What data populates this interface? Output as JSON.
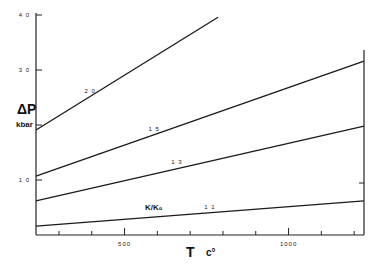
{
  "chart_data": {
    "type": "line",
    "title": "",
    "xlabel": "T",
    "xlabel_unit": "c°",
    "ylabel": "ΔP",
    "ylabel_unit": "kbar",
    "xlim": [
      230,
      1230
    ],
    "ylim": [
      0,
      40
    ],
    "x_ticks": [
      300,
      400,
      500,
      600,
      700,
      800,
      900,
      1000,
      1100,
      1200
    ],
    "x_tick_labels": [
      {
        "value": 500,
        "label": "500"
      },
      {
        "value": 1000,
        "label": "1000"
      }
    ],
    "y_ticks": [
      10,
      20,
      30,
      40
    ],
    "y_tick_labels": [
      {
        "value": 10,
        "label": "1 0"
      },
      {
        "value": 30,
        "label": "3 0"
      },
      {
        "value": 40,
        "label": "4 0"
      }
    ],
    "grid": false,
    "parameter_label": "K/K₀",
    "series": [
      {
        "name": "2.0",
        "label": "2 0",
        "x": [
          230,
          785
        ],
        "y": [
          19.1,
          39.6
        ],
        "label_at": [
          395,
          25.5
        ]
      },
      {
        "name": "1.5",
        "label": "1 5",
        "x": [
          230,
          1230
        ],
        "y": [
          10.7,
          31.6
        ],
        "label_at": [
          590,
          18.6
        ]
      },
      {
        "name": "1.3",
        "label": "1 3",
        "x": [
          230,
          1230
        ],
        "y": [
          6.2,
          19.8
        ],
        "label_at": [
          660,
          12.6
        ]
      },
      {
        "name": "1.1",
        "label": "1 1",
        "x": [
          230,
          1230
        ],
        "y": [
          1.6,
          6.2
        ],
        "label_at": [
          760,
          4.3
        ]
      }
    ]
  }
}
